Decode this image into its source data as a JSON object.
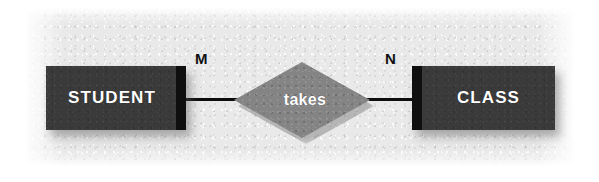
{
  "diagram": {
    "type": "entity-relationship-diagram",
    "entities": [
      {
        "id": "student",
        "label": "STUDENT",
        "shape": "rectangle",
        "fill": "#3a3a3a",
        "text_color": "#ffffff"
      },
      {
        "id": "class",
        "label": "CLASS",
        "shape": "rectangle",
        "fill": "#3a3a3a",
        "text_color": "#ffffff"
      }
    ],
    "relationship": {
      "id": "takes",
      "label": "takes",
      "shape": "diamond",
      "fill": "#848484",
      "text_color": "#ffffff"
    },
    "cardinalities": [
      {
        "id": "left",
        "label": "M",
        "near_entity": "STUDENT"
      },
      {
        "id": "right",
        "label": "N",
        "near_entity": "CLASS"
      }
    ],
    "connectors": [
      {
        "id": "student-takes",
        "from": "STUDENT",
        "to": "takes",
        "color": "#0d0d0d"
      },
      {
        "id": "takes-class",
        "from": "takes",
        "to": "CLASS",
        "color": "#0d0d0d"
      }
    ],
    "canvas": {
      "background": "#e9e9e9",
      "page_background": "#ffffff"
    }
  }
}
